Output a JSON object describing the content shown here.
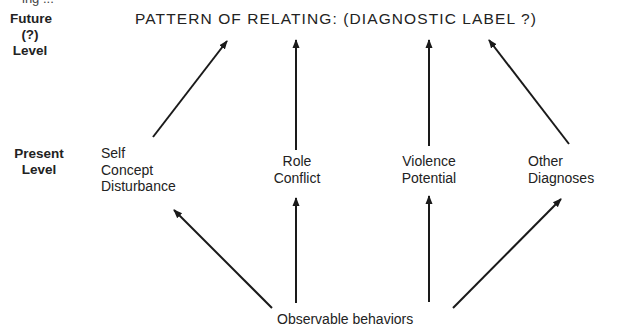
{
  "figure": {
    "cut_off_top_text": "ing ...",
    "title": "PATTERN OF RELATING: (DIAGNOSTIC LABEL ?)",
    "levels": {
      "future": {
        "line1": "Future",
        "line2": "(?)",
        "line3": "Level"
      },
      "present": {
        "line1": "Present",
        "line2": "Level"
      }
    },
    "nodes": [
      {
        "id": "self-concept",
        "lines": [
          "Self",
          "Concept",
          "Disturbance"
        ]
      },
      {
        "id": "role-conflict",
        "lines": [
          "Role",
          "Conflict"
        ]
      },
      {
        "id": "violence-potential",
        "lines": [
          "Violence",
          "Potential"
        ]
      },
      {
        "id": "other-diagnoses",
        "lines": [
          "Other",
          "Diagnoses"
        ]
      }
    ],
    "source": "Observable behaviors",
    "edges": [
      {
        "from": "Observable behaviors",
        "to": "Self Concept Disturbance"
      },
      {
        "from": "Observable behaviors",
        "to": "Role Conflict"
      },
      {
        "from": "Observable behaviors",
        "to": "Violence Potential"
      },
      {
        "from": "Observable behaviors",
        "to": "Other Diagnoses"
      },
      {
        "from": "Self Concept Disturbance",
        "to": "PATTERN OF RELATING: (DIAGNOSTIC LABEL ?)"
      },
      {
        "from": "Role Conflict",
        "to": "PATTERN OF RELATING: (DIAGNOSTIC LABEL ?)"
      },
      {
        "from": "Violence Potential",
        "to": "PATTERN OF RELATING: (DIAGNOSTIC LABEL ?)"
      },
      {
        "from": "Other Diagnoses",
        "to": "PATTERN OF RELATING: (DIAGNOSTIC LABEL ?)"
      }
    ],
    "colors": {
      "ink": "#1a1a1a",
      "background": "#ffffff"
    }
  }
}
